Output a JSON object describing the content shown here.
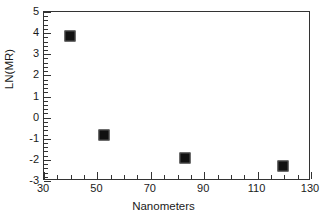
{
  "chart_data": {
    "type": "scatter",
    "title": "",
    "xlabel": "Nanometers",
    "ylabel": "LN(MR)",
    "xlim": [
      30,
      130
    ],
    "ylim": [
      -3,
      5
    ],
    "x_major_ticks": [
      30,
      50,
      70,
      90,
      110,
      130
    ],
    "x_tick_labels": [
      "30",
      "50",
      "70",
      "90",
      "110",
      "130"
    ],
    "x_minor_tick_interval": 5,
    "y_major_ticks": [
      -3,
      -2,
      -1,
      0,
      1,
      2,
      3,
      4,
      5
    ],
    "y_tick_labels": [
      "-3",
      "-2",
      "-1",
      "0",
      "1",
      "2",
      "3",
      "4",
      "5"
    ],
    "y_minor_tick_interval": 0.2,
    "grid": false,
    "legend": null,
    "marker_style": "filled-square",
    "marker_color": "#111111",
    "points": [
      {
        "x": 40,
        "y": 3.8
      },
      {
        "x": 53,
        "y": -0.85
      },
      {
        "x": 83,
        "y": -1.95
      },
      {
        "x": 120,
        "y": -2.35
      }
    ],
    "x": [
      40,
      53,
      83,
      120
    ],
    "values": [
      3.8,
      -0.85,
      -1.95,
      -2.35
    ]
  },
  "colors": {
    "axis": "#333333",
    "text": "#1a1a1a",
    "marker": "#111111",
    "background": "#ffffff"
  }
}
